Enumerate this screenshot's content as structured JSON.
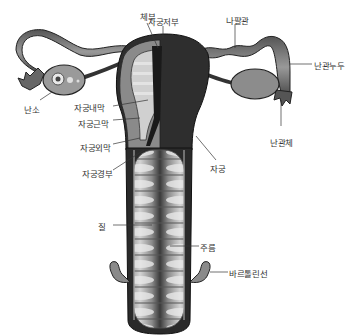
{
  "diagram": {
    "type": "anatomical illustration",
    "labels": {
      "body": "체부",
      "fundus": "자궁저부",
      "fallopian_tube": "나팔관",
      "tubal_fimbria_top": "난관누두",
      "ovary": "난소",
      "endometrium": "자궁내막",
      "myometrium": "자궁근막",
      "perimetrium": "자궁외막",
      "cervix": "자궁경부",
      "uterus": "자궁",
      "fimbriae": "난관체",
      "vagina": "질",
      "rugae": "주름",
      "bartholin_gland": "바르톨린선"
    },
    "colors": {
      "outline": "#2a2a2a",
      "tissue_dark": "#3a3a3a",
      "tissue_mid": "#7a7a7a",
      "tissue_light": "#c8c8c8",
      "ovary_fill": "#9a9a9a",
      "leader_line": "#333333",
      "label_text": "#333333"
    }
  }
}
